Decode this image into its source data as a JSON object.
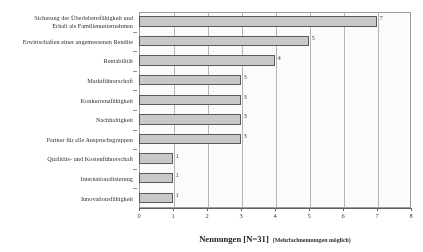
{
  "chart_data": {
    "type": "bar",
    "orientation": "horizontal",
    "title": "",
    "xlabel": "Nennungen [N=31]",
    "xlabel_suffix": "(Mehrfachnennungen möglich)",
    "ylabel": "Wichtige Unternehmensziele",
    "xlim": [
      0,
      8
    ],
    "xticks": [
      "0",
      "1",
      "2",
      "3",
      "4",
      "5",
      "6",
      "7",
      "8"
    ],
    "grid": true,
    "grid_axis": "x",
    "legend": false,
    "bar_fill_color": "#c9c9c9",
    "bar_edge_color": "#555555",
    "categories": [
      "Sicherung der Überlebensfähigkeit und\nErhalt als Familienunternehmen",
      "Erwirtschaften einer angemessenen Rendite",
      "Rentabilität",
      "Marktführerschaft",
      "Konkurrenzfähigkeit",
      "Nachhaltigkeit",
      "Partner für alle Anspruchsgruppen",
      "Qualitäts- und Kostenführerschaft",
      "Internationalisierung",
      "Innovationsfähigkeit"
    ],
    "values": [
      7,
      5,
      4,
      3,
      3,
      3,
      3,
      1,
      1,
      1
    ],
    "value_labels": [
      "7",
      "5",
      "4",
      "3",
      "3",
      "3",
      "3",
      "1",
      "1",
      "1"
    ]
  }
}
